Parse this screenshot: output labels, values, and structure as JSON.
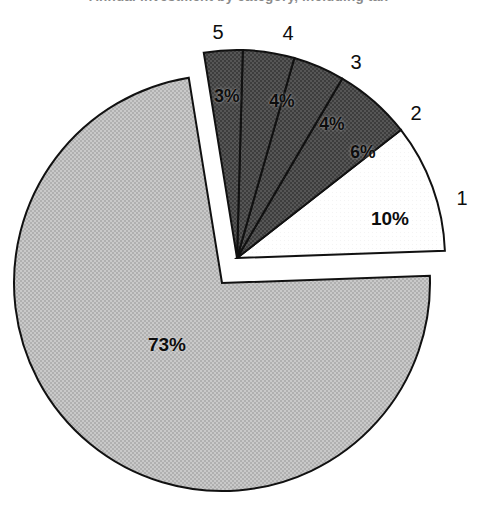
{
  "title": {
    "text": "Annual investment by category, including tax",
    "visible_fragment": "cropped at top edge of image"
  },
  "chart_data": {
    "type": "pie",
    "title": "Annual investment by category, including tax",
    "xlabel": "",
    "ylabel": "",
    "categories": [
      "1",
      "2",
      "3",
      "4",
      "5",
      "6"
    ],
    "values": [
      10,
      6,
      4,
      4,
      3,
      73
    ],
    "value_labels": [
      "10%",
      "6%",
      "4%",
      "4%",
      "3%",
      "73%"
    ],
    "units": "percent",
    "total": 100,
    "legend": "none",
    "grid": false,
    "exploded_slices": [
      "1",
      "2",
      "3",
      "4",
      "5"
    ],
    "slice_fills": {
      "1": "#ffffff",
      "2": "#4a4a4a",
      "3": "#4a4a4a",
      "4": "#4a4a4a",
      "5": "#4a4a4a",
      "6": "#bdbdbd"
    },
    "outline_color": "#111111"
  },
  "slices": [
    {
      "id": "1",
      "label": "1",
      "pct": "10%",
      "value": 10,
      "fill": "#ffffff",
      "exploded": true,
      "label_x": 462,
      "label_y": 198,
      "pct_x": 390,
      "pct_y": 219
    },
    {
      "id": "2",
      "label": "2",
      "pct": "6%",
      "value": 6,
      "fill": "#4a4a4a",
      "exploded": true,
      "label_x": 416,
      "label_y": 113,
      "pct_x": 363,
      "pct_y": 152
    },
    {
      "id": "3",
      "label": "3",
      "pct": "4%",
      "value": 4,
      "fill": "#4a4a4a",
      "exploded": true,
      "label_x": 356,
      "label_y": 62,
      "pct_x": 332,
      "pct_y": 124
    },
    {
      "id": "4",
      "label": "4",
      "pct": "4%",
      "value": 4,
      "fill": "#4a4a4a",
      "exploded": true,
      "label_x": 288,
      "label_y": 33,
      "pct_x": 282,
      "pct_y": 101
    },
    {
      "id": "5",
      "label": "5",
      "pct": "3%",
      "value": 3,
      "fill": "#4a4a4a",
      "exploded": true,
      "label_x": 218,
      "label_y": 32,
      "pct_x": 227,
      "pct_y": 96
    },
    {
      "id": "6",
      "label": "",
      "pct": "73%",
      "value": 73,
      "fill": "#bdbdbd",
      "exploded": false,
      "label_x": 0,
      "label_y": 0,
      "pct_x": 167,
      "pct_y": 345
    }
  ],
  "geometry": {
    "main_center_x": 222,
    "main_center_y": 283,
    "main_radius": 208,
    "explode_center_x": 237,
    "explode_center_y": 258,
    "explode_radius": 208
  }
}
